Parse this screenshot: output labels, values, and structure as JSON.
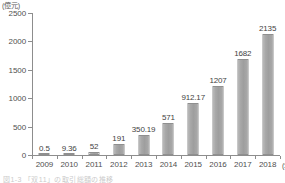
{
  "chart_data": {
    "type": "bar",
    "title": "",
    "xlabel": "(年)",
    "ylabel": "(億元)",
    "categories": [
      "2009",
      "2010",
      "2011",
      "2012",
      "2013",
      "2014",
      "2015",
      "2016",
      "2017",
      "2018"
    ],
    "values": [
      0.5,
      9.36,
      52,
      191,
      350.19,
      571,
      912.17,
      1207,
      1682,
      2135
    ],
    "value_labels": [
      "0.5",
      "9.36",
      "52",
      "191",
      "350.19",
      "571",
      "912.17",
      "1207",
      "1682",
      "2135"
    ],
    "ylim": [
      0,
      2500
    ],
    "yticks": [
      0,
      500,
      1000,
      1500,
      2000,
      2500
    ],
    "ytick_labels": [
      "0",
      "500",
      "1000",
      "1500",
      "2000",
      "2500"
    ],
    "grid": false,
    "legend": false,
    "series": [
      {
        "name": "",
        "values": [
          0.5,
          9.36,
          52,
          191,
          350.19,
          571,
          912.17,
          1207,
          1682,
          2135
        ]
      }
    ],
    "bar_color": "#a4a4a4",
    "axis_color": "#8d8d8d",
    "text_color": "#4f4f4f"
  },
  "caption": {
    "text": "図1-3 「双11」の取引総額の推移"
  }
}
